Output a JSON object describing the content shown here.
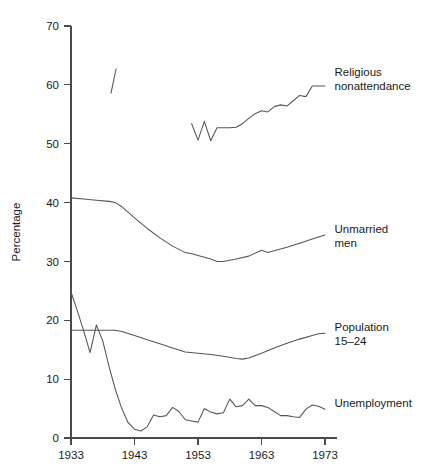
{
  "chart_data": {
    "type": "line",
    "title": "",
    "subtitle": "",
    "xlabel": "",
    "ylabel": "Percentage",
    "xlim": [
      1933,
      1973
    ],
    "ylim": [
      0,
      70
    ],
    "xticks": [
      1933,
      1943,
      1953,
      1963,
      1973
    ],
    "yticks": [
      0,
      10,
      20,
      30,
      40,
      50,
      60,
      70
    ],
    "grid": false,
    "legend_position": "right-inline-labels",
    "series": [
      {
        "name": "Religious nonattendance",
        "label_line1": "Religious",
        "label_line2": "nonattendance",
        "label_x": 1974.5,
        "label_y": 61.5,
        "note": "two disjoint fragments: a short early segment near 1940 and the main 1952-1973 run",
        "segments": [
          {
            "x": [
              1939.3,
              1940.1
            ],
            "values": [
              58.6,
              62.7
            ]
          },
          {
            "x": [
              1952,
              1953,
              1954,
              1955,
              1956,
              1957,
              1958,
              1959,
              1960,
              1961,
              1962,
              1963,
              1964,
              1965,
              1966,
              1967,
              1968,
              1969,
              1970,
              1971,
              1972,
              1973
            ],
            "values": [
              53.4,
              50.6,
              53.8,
              50.5,
              52.7,
              52.7,
              52.7,
              52.8,
              53.4,
              54.3,
              55.1,
              55.6,
              55.4,
              56.3,
              56.6,
              56.4,
              57.3,
              58.2,
              58.0,
              59.8,
              59.8,
              59.8
            ]
          }
        ]
      },
      {
        "name": "Unmarried men",
        "label_line1": "Unmarried",
        "label_line2": "men",
        "label_x": 1974.5,
        "label_y": 34.8,
        "segments": [
          {
            "x": [
              1933,
              1935,
              1937,
              1939,
              1940,
              1941,
              1943,
              1945,
              1947,
              1949,
              1951,
              1952,
              1953,
              1955,
              1956,
              1957,
              1959,
              1961,
              1963,
              1964,
              1965,
              1967,
              1969,
              1971,
              1973
            ],
            "values": [
              40.8,
              40.6,
              40.4,
              40.2,
              40.0,
              39.3,
              37.4,
              35.6,
              34.0,
              32.6,
              31.5,
              31.3,
              31.0,
              30.4,
              30.0,
              30.0,
              30.4,
              30.9,
              31.9,
              31.5,
              31.8,
              32.4,
              33.1,
              33.8,
              34.5
            ]
          }
        ]
      },
      {
        "name": "Population 15-24",
        "label_line1": "Population",
        "label_line2": "15–24",
        "label_x": 1974.5,
        "label_y": 18.2,
        "segments": [
          {
            "x": [
              1933,
              1936,
              1938,
              1940,
              1941,
              1943,
              1945,
              1947,
              1949,
              1951,
              1953,
              1955,
              1957,
              1959,
              1960,
              1961,
              1963,
              1965,
              1967,
              1969,
              1971,
              1972,
              1973
            ],
            "values": [
              18.3,
              18.3,
              18.3,
              18.3,
              18.1,
              17.4,
              16.7,
              16.0,
              15.3,
              14.6,
              14.4,
              14.2,
              13.9,
              13.5,
              13.4,
              13.6,
              14.4,
              15.3,
              16.1,
              16.8,
              17.4,
              17.7,
              17.8
            ]
          }
        ]
      },
      {
        "name": "Unemployment",
        "label_line1": "Unemployment",
        "label_line2": "",
        "label_x": 1974.5,
        "label_y": 5.2,
        "segments": [
          {
            "x": [
              1933,
              1934,
              1935,
              1936,
              1937,
              1938,
              1939,
              1940,
              1941,
              1942,
              1943,
              1944,
              1945,
              1946,
              1947,
              1948,
              1949,
              1950,
              1951,
              1952,
              1953,
              1954,
              1955,
              1956,
              1957,
              1958,
              1959,
              1960,
              1961,
              1962,
              1963,
              1964,
              1965,
              1966,
              1967,
              1968,
              1969,
              1970,
              1971,
              1972,
              1973
            ],
            "values": [
              24.8,
              21.6,
              18.2,
              14.5,
              19.2,
              16.5,
              12.1,
              8.2,
              5.0,
              2.6,
              1.5,
              1.2,
              1.9,
              3.9,
              3.6,
              3.8,
              5.2,
              4.5,
              3.1,
              2.9,
              2.7,
              5.0,
              4.4,
              4.1,
              4.3,
              6.6,
              5.3,
              5.5,
              6.6,
              5.5,
              5.5,
              5.2,
              4.5,
              3.8,
              3.8,
              3.6,
              3.5,
              4.9,
              5.6,
              5.4,
              4.9
            ]
          }
        ]
      }
    ]
  }
}
